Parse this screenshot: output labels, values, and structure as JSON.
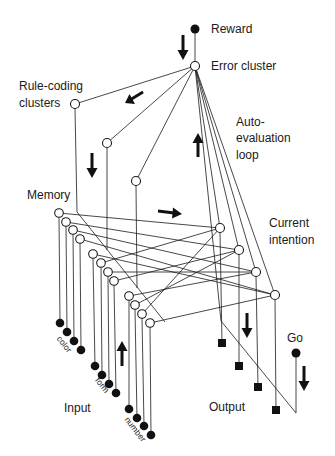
{
  "diagram": {
    "labels": {
      "reward": "Reward",
      "error_cluster": "Error cluster",
      "rule_coding_line1": "Rule-coding",
      "rule_coding_line2": "clusters",
      "auto_eval_line1": "Auto-",
      "auto_eval_line2": "evaluation",
      "auto_eval_line3": "loop",
      "memory": "Memory",
      "current_intention_line1": "Current",
      "current_intention_line2": "intention",
      "go": "Go",
      "output": "Output",
      "input": "Input",
      "input_color": "color",
      "input_form": "form",
      "input_number": "number"
    },
    "node_groups": {
      "reward_units": 1,
      "error_cluster_units": 1,
      "rule_coding_clusters": 3,
      "memory_clusters": 12,
      "input_units": 12,
      "input_dimensions": [
        "color",
        "form",
        "number"
      ],
      "current_intention_clusters": 4,
      "output_units": 4,
      "go_units": 1
    },
    "arrows": [
      {
        "id": "reward-to-error",
        "direction": "down"
      },
      {
        "id": "error-to-rules",
        "direction": "down-left"
      },
      {
        "id": "rules-to-memory",
        "direction": "down"
      },
      {
        "id": "auto-evaluation",
        "direction": "up"
      },
      {
        "id": "memory-to-intention",
        "direction": "right"
      },
      {
        "id": "input-to-memory",
        "direction": "up"
      },
      {
        "id": "intention-to-output",
        "direction": "down"
      },
      {
        "id": "go-signal",
        "direction": "down"
      }
    ]
  }
}
